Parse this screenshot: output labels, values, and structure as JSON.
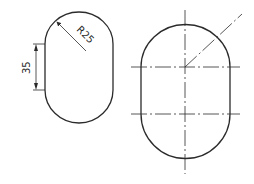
{
  "drawing": {
    "left_view": {
      "radius_label": "R25",
      "length_label": "35"
    },
    "right_view": {
      "centerlines": [
        "vertical",
        "horizontal-upper",
        "horizontal-lower",
        "diagonal"
      ]
    },
    "line_color": "#2b2b2b",
    "background": "#ffffff"
  }
}
